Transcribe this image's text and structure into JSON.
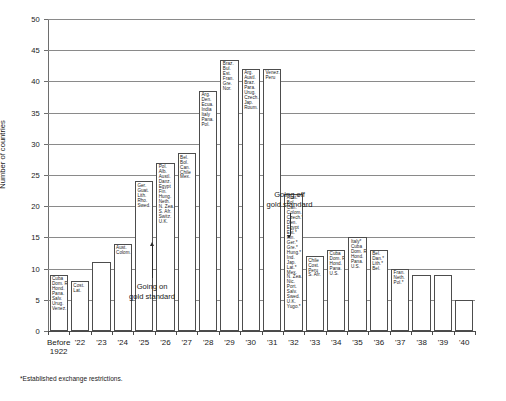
{
  "chart_data": {
    "type": "bar",
    "title": "",
    "subtitle": "",
    "xlabel": "",
    "ylabel": "Number of countries",
    "ylim": [
      0,
      50
    ],
    "ytick_step": 5,
    "yticks": [
      "0",
      "5",
      "10",
      "15",
      "20",
      "25",
      "30",
      "35",
      "40",
      "45",
      "50"
    ],
    "grid": true,
    "grid_axis": "y",
    "legend": false,
    "categories": [
      "Before 1922",
      "'22",
      "'23",
      "'24",
      "'25",
      "'26",
      "'27",
      "'28",
      "'29",
      "'30",
      "'31",
      "'32",
      "'33",
      "'34",
      "'35",
      "'36",
      "'37",
      "'38",
      "'39",
      "'40"
    ],
    "category_lines": [
      [
        "Before",
        "1922"
      ],
      [
        "'22"
      ],
      [
        "'23"
      ],
      [
        "'24"
      ],
      [
        "'25"
      ],
      [
        "'26"
      ],
      [
        "'27"
      ],
      [
        "'28"
      ],
      [
        "'29"
      ],
      [
        "'30"
      ],
      [
        "'31"
      ],
      [
        "'32"
      ],
      [
        "'33"
      ],
      [
        "'34"
      ],
      [
        "'35"
      ],
      [
        "'36"
      ],
      [
        "'37"
      ],
      [
        "'38"
      ],
      [
        "'39"
      ],
      [
        "'40"
      ]
    ],
    "values": [
      9,
      8,
      11,
      14,
      24,
      27,
      38.5,
      43.5,
      42,
      42,
      22,
      12,
      13,
      15,
      13,
      10,
      9,
      9,
      5,
      0
    ],
    "bar_country_labels": [
      [
        "Cuba",
        "Dom. R.",
        "Hond.",
        "Pana.",
        "Salv.",
        "Urug.",
        "U.S.",
        "Venez."
      ],
      [
        "Cost.",
        "Lat."
      ],
      [],
      [
        "Aust.",
        "Colom."
      ],
      [
        "Ger.",
        "Guat.",
        "Lith.",
        "Rho.",
        "Swed."
      ],
      [
        "Pol.",
        "Alb.",
        "Austl.",
        "Danz.",
        "Egypt",
        "Fin.",
        "Hung.",
        "Neth.",
        "N. Zea.",
        "S. Afr.",
        "Switz.",
        "U.K."
      ],
      [
        "Bel.",
        "Bol.",
        "Can.",
        "Chile",
        "Mex."
      ],
      [
        "Arg.",
        "Den.",
        "Ecua.",
        "India",
        "Italy",
        "Pana.",
        "Pol."
      ],
      [
        "Braz.",
        "Bul.",
        "Est.",
        "Fran.",
        "Gre.",
        "Nor."
      ],
      [
        "Arg.",
        "Austl.",
        "Braz.",
        "Para.",
        "Urug.",
        "Czech.",
        "Jap.",
        "Roum."
      ],
      [
        "Venez.",
        "Peru"
      ],
      [
        "Aust.*",
        "Bol.",
        "Can.",
        "Colom.",
        "Czech.*",
        "Den.",
        "Egypt",
        "Est.*",
        "Fin.",
        "Ger.*",
        "Gre.*",
        "Hung.*",
        "Ind.",
        "Jap.",
        "Lat.*",
        "Mex.",
        "N. Zea.",
        "Nic.",
        "Port.",
        "Salv.",
        "Swed.",
        "U.K.",
        "Yugo.*",
        "Roum.*",
        "Pols."
      ],
      [
        "Chile",
        "Cost.",
        "Peru",
        "S. Afr."
      ],
      [
        "Cuba",
        "Dom. R.",
        "Hond.",
        "Pana.",
        "U.S."
      ],
      [
        "Italy*",
        "Cuba",
        "Dom. R.",
        "Hond.",
        "Pana.",
        "U.S."
      ],
      [
        "Bel.",
        "Dan.*",
        "Lith.*",
        "Bel."
      ],
      [
        "Fran.",
        "Neth.",
        "Pol.*"
      ],
      [],
      [],
      [],
      []
    ],
    "annotations": [
      {
        "id": "going-on",
        "text_lines": [
          "Going on",
          "gold standard"
        ],
        "arrow": "up",
        "near_category": "'25"
      },
      {
        "id": "going-off",
        "text_lines": [
          "Going off",
          "gold standard"
        ],
        "arrow": "down",
        "near_category": "'31"
      }
    ],
    "footnote": "*Established exchange restrictions."
  },
  "bars": [
    {
      "category": "Before 1922",
      "value": 9,
      "labels": [
        "Cuba",
        "Dom. R.",
        "Hond.",
        "Pana.",
        "Salv.",
        "Urug.",
        "Venez."
      ]
    },
    {
      "category": "'22",
      "value": 8,
      "labels": [
        "Cost.",
        "Lat."
      ]
    },
    {
      "category": "'23",
      "value": 11,
      "labels": []
    },
    {
      "category": "'24",
      "value": 14,
      "labels": [
        "Aust.",
        "Colom."
      ]
    },
    {
      "category": "'25",
      "value": 24,
      "labels": [
        "Ger.",
        "Guat.",
        "Lith.",
        "Rho.",
        "Swed."
      ]
    },
    {
      "category": "'26",
      "value": 27,
      "labels": [
        "Pol.",
        "Alb.",
        "Austl.",
        "Danz.",
        "Egypt",
        "Fin.",
        "Hung.",
        "Neth.",
        "N. Zea.",
        "S. Afr.",
        "Switz.",
        "U.K."
      ]
    },
    {
      "category": "'27",
      "value": 28.5,
      "labels": [
        "Bel.",
        "Bol.",
        "Can.",
        "Chile",
        "Mex."
      ]
    },
    {
      "category": "'28",
      "value": 38.5,
      "labels": [
        "Arg.",
        "Den.",
        "Ecua.",
        "India",
        "Italy",
        "Pana.",
        "Pol."
      ]
    },
    {
      "category": "'29",
      "value": 43.5,
      "labels": [
        "Braz.",
        "Bul.",
        "Est.",
        "Fran.",
        "Gre.",
        "Nor."
      ]
    },
    {
      "category": "'30",
      "value": 42,
      "labels": [
        "Arg.",
        "Austl.",
        "Braz.",
        "Para.",
        "Urug.",
        "Czech.",
        "Jap.",
        "Roum."
      ]
    },
    {
      "category": "'31",
      "value": 42,
      "labels": [
        "Venez.",
        "Peru"
      ]
    },
    {
      "category": "'32",
      "value": 22,
      "labels": [
        "Aust.*",
        "Bol.",
        "Can.",
        "Colom.",
        "Czech.*",
        "Den.",
        "Egypt",
        "Est.*",
        "Fin.",
        "Ger.*",
        "Gre.*",
        "Hung.*",
        "Ind.",
        "Jap.",
        "Lat.*",
        "Mex.",
        "N. Zea.",
        "Nic.",
        "Port.",
        "Salv.",
        "Swed.",
        "U.K.",
        "Yugo.*"
      ]
    },
    {
      "category": "'33",
      "value": 12,
      "labels": [
        "Chile",
        "Cost.",
        "Peru",
        "S. Afr."
      ]
    },
    {
      "category": "'34",
      "value": 13,
      "labels": [
        "Cuba",
        "Dom. R.",
        "Hond.",
        "Pana.",
        "U.S."
      ]
    },
    {
      "category": "'35",
      "value": 15,
      "labels": [
        "Italy*",
        "Cuba",
        "Dom. R.",
        "Hond.",
        "Pana.",
        "U.S."
      ]
    },
    {
      "category": "'36",
      "value": 13,
      "labels": [
        "Bel.",
        "Dan.*",
        "Lith.*",
        "Bel."
      ]
    },
    {
      "category": "'37",
      "value": 10,
      "labels": [
        "Fran.",
        "Neth.",
        "Pol.*"
      ]
    },
    {
      "category": "'38",
      "value": 9,
      "labels": []
    },
    {
      "category": "'39",
      "value": 9,
      "labels": []
    },
    {
      "category": "'40",
      "value": 5,
      "labels": []
    }
  ],
  "axes": {
    "y_title": "Number of countries",
    "y_labels": [
      "50",
      "45",
      "40",
      "35",
      "30",
      "25",
      "20",
      "15",
      "10",
      "5",
      "0"
    ],
    "x_labels": [
      [
        "Before",
        "1922"
      ],
      [
        "'22"
      ],
      [
        "'23"
      ],
      [
        "'24"
      ],
      [
        "'25"
      ],
      [
        "'26"
      ],
      [
        "'27"
      ],
      [
        "'28"
      ],
      [
        "'29"
      ],
      [
        "'30"
      ],
      [
        "'31"
      ],
      [
        "'32"
      ],
      [
        "'33"
      ],
      [
        "'34"
      ],
      [
        "'35"
      ],
      [
        "'36"
      ],
      [
        "'37"
      ],
      [
        "'38"
      ],
      [
        "'39"
      ],
      [
        "'40"
      ]
    ]
  },
  "annotations": {
    "going_on": {
      "line1": "Going on",
      "line2": "gold standard"
    },
    "going_off": {
      "line1": "Going off",
      "line2": "gold standard"
    }
  },
  "footnote": {
    "text": "*Established exchange restrictions."
  },
  "colors": {
    "background": "#ffffff",
    "bar_fill": "#ffffff",
    "bar_stroke": "#4d4d4d",
    "gridline": "#8a8a8a",
    "axis": "#4a4a4a",
    "text": "#1a1a1a"
  }
}
